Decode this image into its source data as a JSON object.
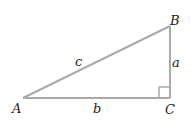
{
  "diagram": {
    "vertices": {
      "A": "A",
      "B": "B",
      "C": "C"
    },
    "sides": {
      "a": "a",
      "b": "b",
      "c": "c"
    },
    "right_angle_at": "C",
    "line_color": "#aaaaaa",
    "label_color": "#222222"
  }
}
